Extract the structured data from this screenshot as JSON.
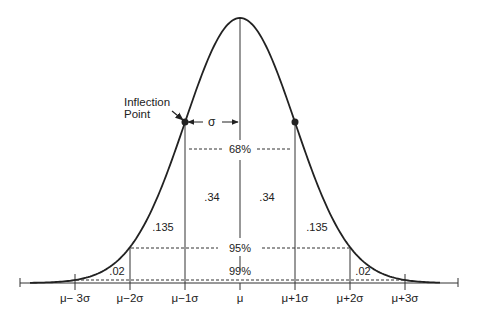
{
  "diagram": {
    "annotation": {
      "inflection_line1": "Inflection",
      "inflection_line2": "Point",
      "sigma_label": "σ"
    },
    "intervals": {
      "pct68": "68%",
      "pct95": "95%",
      "pct99": "99%"
    },
    "areas": {
      "inner_left": ".34",
      "inner_right": ".34",
      "mid_left": ".135",
      "mid_right": ".135",
      "tail_left": ".02",
      "tail_right": ".02"
    },
    "axis_ticks": [
      "μ− 3σ",
      "μ−2σ",
      "μ−1σ",
      "μ",
      "μ+1σ",
      "μ+2σ",
      "μ+3σ"
    ]
  },
  "chart_data": {
    "type": "line",
    "x": [
      "μ−3σ",
      "μ−2σ",
      "μ−1σ",
      "μ",
      "μ+1σ",
      "μ+2σ",
      "μ+3σ"
    ],
    "values": [
      0.011,
      0.135,
      0.607,
      1.0,
      0.607,
      0.135,
      0.011
    ],
    "area_labels": {
      "within_1sigma_each_side": 0.34,
      "between_1_and_2_sigma": 0.135,
      "between_2_and_3_sigma": 0.02
    },
    "intervals": [
      {
        "range": "±1σ",
        "label": "68%"
      },
      {
        "range": "±2σ",
        "label": "95%"
      },
      {
        "range": "±3σ",
        "label": "99%"
      }
    ],
    "annotations": [
      "Inflection Point",
      "σ"
    ]
  }
}
